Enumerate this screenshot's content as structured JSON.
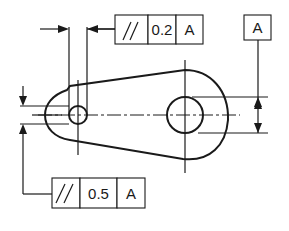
{
  "diagram": {
    "type": "gd&t-parallelism-drawing",
    "colors": {
      "line": "#1a1a1a",
      "background": "#ffffff"
    },
    "datum_feature": {
      "label": "A"
    },
    "feature_control_frames": [
      {
        "id": "top",
        "symbol": "//",
        "symbol_name": "parallelism",
        "tolerance": "0.2",
        "datum": "A"
      },
      {
        "id": "bottom",
        "symbol": "//",
        "symbol_name": "parallelism",
        "tolerance": "0.5",
        "datum": "A"
      }
    ],
    "part": {
      "description": "tapered link with small hole (left) and large hole (right)",
      "small_hole": {
        "center": [
          78,
          115
        ],
        "radius": 9
      },
      "large_hole": {
        "center": [
          185,
          115
        ],
        "radius": 18
      }
    }
  }
}
